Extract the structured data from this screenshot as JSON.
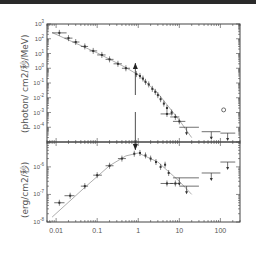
{
  "chart_data": [
    {
      "type": "scatter",
      "panel": "top",
      "title": "",
      "xlabel": "",
      "ylabel": "(photon/ cm2/秒/MeV)",
      "xscale": "log",
      "yscale": "log",
      "xlim": [
        0.006,
        300
      ],
      "ylim": [
        1e-05,
        1000
      ],
      "yticks": [
        "10^3",
        "10^2",
        "10^1",
        "10^0",
        "10^-1",
        "10^-2",
        "10^-3",
        "10^-4"
      ],
      "grid": false,
      "series": [
        {
          "name": "data",
          "points": [
            {
              "x": 0.012,
              "y": 250,
              "xerr_lo": 0.008,
              "xerr_hi": 0.018
            },
            {
              "x": 0.02,
              "y": 110,
              "xerr_lo": 0.016,
              "xerr_hi": 0.025
            },
            {
              "x": 0.03,
              "y": 60,
              "xerr_lo": 0.025,
              "xerr_hi": 0.037
            },
            {
              "x": 0.05,
              "y": 30,
              "xerr_lo": 0.04,
              "xerr_hi": 0.06
            },
            {
              "x": 0.08,
              "y": 15,
              "xerr_lo": 0.065,
              "xerr_hi": 0.1
            },
            {
              "x": 0.13,
              "y": 8,
              "xerr_lo": 0.1,
              "xerr_hi": 0.16
            },
            {
              "x": 0.2,
              "y": 4,
              "xerr_lo": 0.16,
              "xerr_hi": 0.25
            },
            {
              "x": 0.32,
              "y": 2,
              "xerr_lo": 0.25,
              "xerr_hi": 0.4
            },
            {
              "x": 0.5,
              "y": 1,
              "xerr_lo": 0.4,
              "xerr_hi": 0.63
            },
            {
              "x": 0.9,
              "y": 0.4
            },
            {
              "x": 1.1,
              "y": 0.3
            },
            {
              "x": 1.3,
              "y": 0.2
            },
            {
              "x": 1.5,
              "y": 0.12
            },
            {
              "x": 1.8,
              "y": 0.08
            },
            {
              "x": 2.2,
              "y": 0.04
            },
            {
              "x": 2.6,
              "y": 0.025
            },
            {
              "x": 3.0,
              "y": 0.015
            },
            {
              "x": 3.5,
              "y": 0.008
            },
            {
              "x": 4.2,
              "y": 0.004
            },
            {
              "x": 5,
              "y": 0.002
            },
            {
              "x": 5,
              "y": 0.0008,
              "xerr_lo": 3.5,
              "xerr_hi": 7
            },
            {
              "x": 6.5,
              "y": 0.001
            },
            {
              "x": 8,
              "y": 0.0005,
              "xerr_lo": 6,
              "xerr_hi": 10
            },
            {
              "x": 10,
              "y": 0.00025,
              "xerr_lo": 7,
              "xerr_hi": 14
            },
            {
              "x": 15,
              "y": 0.0001,
              "xerr_lo": 10,
              "xerr_hi": 30,
              "upper_limit": true
            },
            {
              "x": 60,
              "y": 5e-05,
              "xerr_lo": 35,
              "xerr_hi": 100,
              "upper_limit": true
            },
            {
              "x": 150,
              "y": 4e-05,
              "xerr_lo": 100,
              "xerr_hi": 230,
              "upper_limit": true
            }
          ]
        },
        {
          "name": "model",
          "line": true,
          "points": [
            {
              "x": 0.008,
              "y": 260
            },
            {
              "x": 0.1,
              "y": 11
            },
            {
              "x": 0.5,
              "y": 1.1
            },
            {
              "x": 1,
              "y": 0.35
            },
            {
              "x": 3,
              "y": 0.02
            },
            {
              "x": 10,
              "y": 0.0003
            },
            {
              "x": 20,
              "y": 2e-05
            }
          ]
        }
      ],
      "annotations": [
        {
          "type": "arrow",
          "direction": "up",
          "x": 0.85,
          "from_y": 0.05,
          "to_y": 0.9
        },
        {
          "type": "marker",
          "shape": "circle",
          "x": 120,
          "y": 0.0015
        }
      ]
    },
    {
      "type": "scatter",
      "panel": "bottom",
      "title": "",
      "xlabel": "",
      "ylabel": "(erg/cm2/秒)",
      "xscale": "log",
      "yscale": "log",
      "xlim": [
        0.006,
        300
      ],
      "ylim": [
        1e-08,
        8e-06
      ],
      "xticks": [
        "0.01",
        "0.1",
        "1",
        "10",
        "100"
      ],
      "yticks": [
        "10^-6",
        "10^-7",
        "10^-8"
      ],
      "grid": false,
      "series": [
        {
          "name": "data",
          "points": [
            {
              "x": 0.012,
              "y": 5e-08,
              "xerr_lo": 0.009,
              "xerr_hi": 0.016
            },
            {
              "x": 0.022,
              "y": 9e-08,
              "xerr_lo": 0.016,
              "xerr_hi": 0.028
            },
            {
              "x": 0.05,
              "y": 2e-07,
              "xerr_lo": 0.04,
              "xerr_hi": 0.06
            },
            {
              "x": 0.1,
              "y": 5e-07,
              "xerr_lo": 0.08,
              "xerr_hi": 0.13
            },
            {
              "x": 0.2,
              "y": 1.1e-06,
              "xerr_lo": 0.16,
              "xerr_hi": 0.25
            },
            {
              "x": 0.4,
              "y": 2e-06,
              "xerr_lo": 0.32,
              "xerr_hi": 0.5
            },
            {
              "x": 0.8,
              "y": 3e-06
            },
            {
              "x": 1.1,
              "y": 3.2e-06
            },
            {
              "x": 1.5,
              "y": 2.6e-06
            },
            {
              "x": 2,
              "y": 2e-06
            },
            {
              "x": 2.7,
              "y": 1.5e-06
            },
            {
              "x": 3.5,
              "y": 1e-06
            },
            {
              "x": 4.5,
              "y": 1.2e-06
            },
            {
              "x": 5.5,
              "y": 6e-07
            },
            {
              "x": 5,
              "y": 2.5e-07,
              "xerr_lo": 3.5,
              "xerr_hi": 7
            },
            {
              "x": 8,
              "y": 2.5e-07,
              "xerr_lo": 6,
              "xerr_hi": 10
            },
            {
              "x": 10,
              "y": 4e-07,
              "xerr_lo": 7,
              "xerr_hi": 30,
              "upper_limit": true
            },
            {
              "x": 15,
              "y": 2e-07,
              "xerr_lo": 10,
              "xerr_hi": 30,
              "upper_limit": true
            },
            {
              "x": 60,
              "y": 6e-07,
              "xerr_lo": 35,
              "xerr_hi": 100,
              "upper_limit": true
            },
            {
              "x": 150,
              "y": 1.5e-06,
              "xerr_lo": 100,
              "xerr_hi": 230,
              "upper_limit": true
            }
          ]
        },
        {
          "name": "model",
          "line": true,
          "points": [
            {
              "x": 0.008,
              "y": 1.5e-08
            },
            {
              "x": 0.05,
              "y": 1.8e-07
            },
            {
              "x": 0.2,
              "y": 1.1e-06
            },
            {
              "x": 0.5,
              "y": 2.5e-06
            },
            {
              "x": 1,
              "y": 3.2e-06
            },
            {
              "x": 3,
              "y": 1.5e-06
            },
            {
              "x": 10,
              "y": 3e-07
            },
            {
              "x": 20,
              "y": 1e-07
            }
          ]
        }
      ],
      "annotations": [
        {
          "type": "arrow",
          "direction": "down",
          "x": 0.85,
          "from_y": 3e-05,
          "to_y": 3.2e-06
        }
      ]
    }
  ],
  "labels": {
    "top_ylabel": "(photon/ cm2/秒/MeV)",
    "bottom_ylabel": "(erg/cm2/秒)"
  }
}
